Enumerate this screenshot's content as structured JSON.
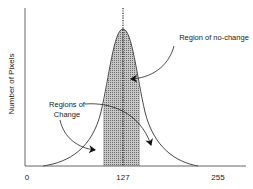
{
  "diagram": {
    "type": "histogram-bell-curve",
    "y_axis_label": "Number of Pixels",
    "x_ticks": [
      {
        "label": "0",
        "value": 0
      },
      {
        "label": "127",
        "value": 127
      },
      {
        "label": "255",
        "value": 255
      }
    ],
    "annotations": {
      "no_change": "Region of no-change",
      "change_line1": "Regions of",
      "change_line2": "Change"
    },
    "colors": {
      "line": "#333333",
      "shade": "#9a9a9a",
      "background": "#ffffff"
    }
  }
}
